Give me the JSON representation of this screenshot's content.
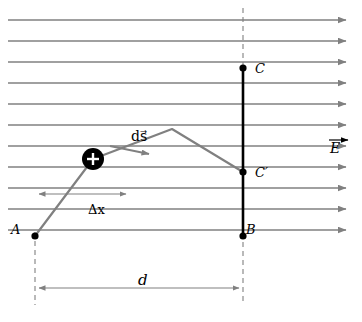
{
  "figure": {
    "labels": {
      "point_a": "A",
      "point_b": "B",
      "point_c": "C",
      "point_c_prime": "C′",
      "displacement_element": "ds⃗",
      "displacement_element_plain": "ds",
      "delta_x": "Δx",
      "distance_d": "d",
      "field": "E⃗",
      "field_plain": "E"
    },
    "colors": {
      "field_lines": "#808080",
      "path": "#808080",
      "vertical_line": "#000000",
      "dashed": "#808080",
      "charge_fill": "#000000",
      "charge_sign": "#ffffff",
      "background": "#ffffff"
    },
    "field_lines": {
      "count": 11,
      "direction": "right",
      "x_start": 8,
      "x_end": 352,
      "y_values": [
        20,
        41,
        62,
        83,
        104,
        125,
        146,
        167,
        188,
        209,
        230
      ]
    },
    "points": [
      {
        "name": "A",
        "x": 35,
        "y": 236
      },
      {
        "name": "B",
        "x": 243,
        "y": 236
      },
      {
        "name": "C",
        "x": 243,
        "y": 68
      },
      {
        "name": "C'",
        "x": 243,
        "y": 172
      }
    ],
    "path_vertices": [
      {
        "x": 35,
        "y": 236
      },
      {
        "x": 93,
        "y": 159
      },
      {
        "x": 172,
        "y": 129
      },
      {
        "x": 243,
        "y": 172
      }
    ],
    "charge": {
      "x": 93,
      "y": 159,
      "radius": 11,
      "sign": "+"
    },
    "ds_arrow": {
      "x1": 110,
      "y1": 146,
      "x2": 152,
      "y2": 155
    },
    "delta_x_measure": {
      "x1": 35,
      "x2": 130,
      "y": 194
    },
    "d_measure": {
      "x1": 35,
      "x2": 243,
      "y": 288
    },
    "dashed_verticals": [
      {
        "x": 35,
        "y1": 236,
        "y2": 305
      },
      {
        "x": 243,
        "y1": 10,
        "y2": 305
      }
    ]
  }
}
